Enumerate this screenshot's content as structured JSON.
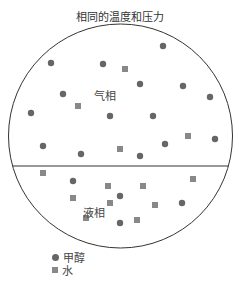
{
  "title": "相同的温度和压力",
  "phases": {
    "vapor_label": "气相",
    "liquid_label": "液相"
  },
  "legend": [
    {
      "shape": "circle",
      "label": "甲醇"
    },
    {
      "shape": "square",
      "label": "水"
    }
  ],
  "colors": {
    "methanol": "#666666",
    "water": "#888888",
    "outline": "#333333"
  },
  "container": {
    "cx": 120.5,
    "cy": 136,
    "r": 112,
    "divider_y": 166
  },
  "particles": {
    "vapor": {
      "methanol": [
        [
          163,
          46
        ],
        [
          51,
          63
        ],
        [
          103,
          64
        ],
        [
          140,
          84
        ],
        [
          183,
          86
        ],
        [
          63,
          94
        ],
        [
          210,
          97
        ],
        [
          31,
          113
        ],
        [
          110,
          116
        ],
        [
          153,
          116
        ],
        [
          215,
          139
        ],
        [
          43,
          146
        ],
        [
          81,
          154
        ],
        [
          140,
          156
        ],
        [
          165,
          144
        ]
      ],
      "water": [
        [
          125,
          69
        ],
        [
          78,
          106
        ],
        [
          188,
          136
        ],
        [
          120,
          149
        ]
      ]
    },
    "liquid": {
      "methanol": [
        [
          73,
          181
        ],
        [
          120,
          196
        ],
        [
          182,
          203
        ],
        [
          120,
          223
        ]
      ],
      "water": [
        [
          43,
          173
        ],
        [
          108,
          186
        ],
        [
          143,
          186
        ],
        [
          193,
          179
        ],
        [
          73,
          198
        ],
        [
          110,
          203
        ],
        [
          155,
          205
        ],
        [
          86,
          218
        ],
        [
          137,
          220
        ]
      ]
    }
  }
}
